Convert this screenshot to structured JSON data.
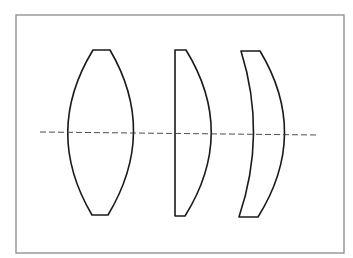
{
  "diagram": {
    "title": "",
    "colors": {
      "background": "#ffffff",
      "frame": "#8a8a8a",
      "lens_outline": "#1a1a1a",
      "axis": "#3a3a3a"
    },
    "frame": {
      "x": 16,
      "y": 15,
      "width": 328,
      "height": 238
    },
    "optical_axis": {
      "style": "dashed",
      "x1": 40,
      "y1": 132,
      "x2": 318,
      "y2": 135
    },
    "lenses": [
      {
        "name": "biconvex-lens",
        "type": "biconvex",
        "path": "M93,50 L110,50 Q158,132 108,215 L92,215 Q43,132 93,50 Z"
      },
      {
        "name": "plano-convex-lens",
        "type": "plano-convex",
        "path": "M175,50 L186,50 Q237,133 185,216 L175,216 Z"
      },
      {
        "name": "meniscus-lens",
        "type": "positive-meniscus",
        "path": "M241,51 L260,51 Q310,134 258,217 L239,217 Q267,134 241,51 Z"
      }
    ]
  }
}
